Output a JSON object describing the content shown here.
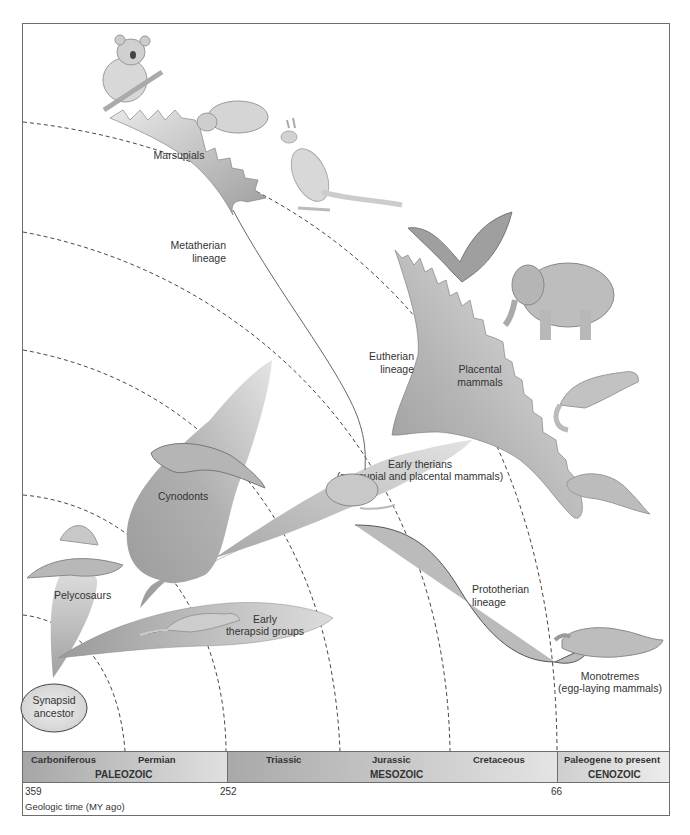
{
  "figure": {
    "colors": {
      "clade_fill_dark": "#a2a2a2",
      "clade_fill_light": "#e6e6e6",
      "frame_border": "#6d6d6d",
      "text": "#333333"
    }
  },
  "clades": {
    "synapsid": "Synapsid\nancestor",
    "synapsid_line1": "Synapsid",
    "synapsid_line2": "ancestor",
    "pelycosaurs": "Pelycosaurs",
    "cynodonts": "Cynodonts",
    "early_therapsid_line1": "Early",
    "early_therapsid_line2": "therapsid groups",
    "early_therians_line1": "Early therians",
    "early_therians_line2": "(marsupial and placental mammals)",
    "marsupials": "Marsupials",
    "metatherian_line1": "Metatherian",
    "metatherian_line2": "lineage",
    "eutherian_line1": "Eutherian",
    "eutherian_line2": "lineage",
    "placental_line1": "Placental",
    "placental_line2": "mammals",
    "prototherian_line1": "Prototherian",
    "prototherian_line2": "lineage",
    "monotremes_line1": "Monotremes",
    "monotremes_line2": "(egg-laying mammals)"
  },
  "animals": [
    "koala",
    "wombat",
    "kangaroo",
    "bat",
    "elephant",
    "ferret",
    "manatee",
    "early-therian-mammal",
    "dimetrodon",
    "cynodont",
    "therapsid",
    "platypus"
  ],
  "timeline": {
    "eras": [
      {
        "name": "PALEOZOIC",
        "periods": [
          "Carboniferous",
          "Permian"
        ]
      },
      {
        "name": "MESOZOIC",
        "periods": [
          "Triassic",
          "Jurassic",
          "Cretaceous"
        ]
      },
      {
        "name": "CENOZOIC",
        "periods": [
          "Paleogene to present"
        ]
      }
    ],
    "ticks": [
      "359",
      "252",
      "66"
    ],
    "axis_label": "Geologic time (MY ago)"
  }
}
